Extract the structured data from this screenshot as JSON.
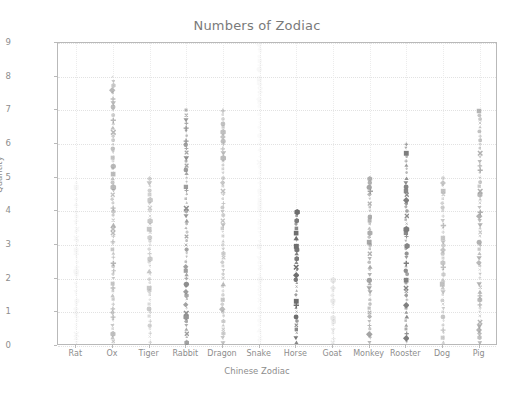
{
  "chart_data": {
    "type": "scatter",
    "title": "Numbers of Zodiac",
    "xlabel": "Chinese Zodiac",
    "ylabel": "Quantity",
    "categories": [
      "Rat",
      "Ox",
      "Tiger",
      "Rabbit",
      "Dragon",
      "Snake",
      "Horse",
      "Goat",
      "Monkey",
      "Rooster",
      "Dog",
      "Pig"
    ],
    "values": [
      5,
      8,
      5,
      7,
      7,
      9,
      4,
      2,
      5,
      6,
      5,
      7
    ],
    "xlim": [
      -0.5,
      11.5
    ],
    "ylim": [
      0,
      9
    ],
    "ytick_labels": [
      "0",
      "1",
      "2",
      "3",
      "4",
      "5",
      "6",
      "7",
      "8",
      "9"
    ],
    "yticks": [
      0,
      1,
      2,
      3,
      4,
      5,
      6,
      7,
      8,
      9
    ],
    "grid": true,
    "legend": null,
    "series": [
      {
        "name": "Rat",
        "category": "Rat",
        "max": 5,
        "color": "#d9d9d9",
        "opacity": 0.18,
        "points": 40
      },
      {
        "name": "Ox",
        "category": "Ox",
        "max": 8,
        "color": "#9a9a9a",
        "opacity": 0.62,
        "points": 64
      },
      {
        "name": "Tiger",
        "category": "Tiger",
        "max": 5,
        "color": "#a5a5a5",
        "opacity": 0.55,
        "points": 40
      },
      {
        "name": "Rabbit",
        "category": "Rabbit",
        "max": 7,
        "color": "#858585",
        "opacity": 0.8,
        "points": 56
      },
      {
        "name": "Dragon",
        "category": "Dragon",
        "max": 7,
        "color": "#9d9d9d",
        "opacity": 0.6,
        "points": 56
      },
      {
        "name": "Snake",
        "category": "Snake",
        "max": 9,
        "color": "#dedede",
        "opacity": 0.16,
        "points": 72
      },
      {
        "name": "Horse",
        "category": "Horse",
        "max": 4,
        "color": "#6e6e6e",
        "opacity": 0.95,
        "points": 32
      },
      {
        "name": "Goat",
        "category": "Goat",
        "max": 2,
        "color": "#c2c2c2",
        "opacity": 0.35,
        "points": 16
      },
      {
        "name": "Monkey",
        "category": "Monkey",
        "max": 5,
        "color": "#8f8f8f",
        "opacity": 0.72,
        "points": 40
      },
      {
        "name": "Rooster",
        "category": "Rooster",
        "max": 6,
        "color": "#7c7c7c",
        "opacity": 0.88,
        "points": 48
      },
      {
        "name": "Dog",
        "category": "Dog",
        "max": 5,
        "color": "#a0a0a0",
        "opacity": 0.58,
        "points": 40
      },
      {
        "name": "Pig",
        "category": "Pig",
        "max": 7,
        "color": "#949494",
        "opacity": 0.66,
        "points": 56
      }
    ],
    "marker_shapes": [
      "diamond",
      "square",
      "circle",
      "triangle-down",
      "triangle-up",
      "x-mark",
      "plus",
      "hexagon"
    ],
    "axis_color": "#b9b9b9",
    "grid_color": "#e6e6e6",
    "text_color": "#8d8d8d",
    "background": "#ffffff"
  }
}
